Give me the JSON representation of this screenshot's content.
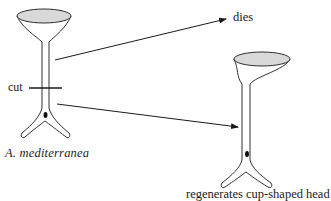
{
  "diagram": {
    "labels": {
      "cut": "cut",
      "species": "A. mediterranea",
      "outcome_top": "dies",
      "outcome_bottom": "regenerates cup-shaped head"
    },
    "nodes": [
      {
        "id": "original-alga",
        "label": "A. mediterranea",
        "shape": "cup-shaped head on stalk with rhizoid and nucleus"
      },
      {
        "id": "top-fragment-outcome",
        "label": "dies"
      },
      {
        "id": "bottom-fragment-outcome",
        "label": "regenerates cup-shaped head",
        "shape": "cup-shaped head on stalk with rhizoid and nucleus"
      }
    ],
    "edges": [
      {
        "from": "original-alga (above cut)",
        "to": "top-fragment-outcome",
        "type": "arrow"
      },
      {
        "from": "original-alga (below cut)",
        "to": "bottom-fragment-outcome",
        "type": "arrow"
      }
    ],
    "colors": {
      "line": "#1a1a1a",
      "cup_fill": "#d9d9d9",
      "background": "#ffffff"
    }
  }
}
